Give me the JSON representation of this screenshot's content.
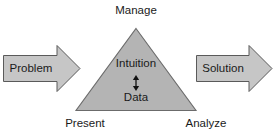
{
  "diagram": {
    "colors": {
      "shape_fill": "#b4b4b4",
      "shape_stroke": "#6b6b6b",
      "arrow_fill": "#c6c6c6",
      "arrow_stroke": "#5a5a5a",
      "text": "#1a1a1a",
      "background": "#ffffff"
    },
    "triangle": {
      "vertex_labels": {
        "top": "Manage",
        "bottom_left": "Present",
        "bottom_right": "Analyze"
      },
      "inner_nodes": [
        {
          "label": "Intuition"
        },
        {
          "label": "Data"
        }
      ],
      "inner_connector": "double-headed-vertical-arrow"
    },
    "input_arrow": {
      "label": "Problem",
      "direction": "right"
    },
    "output_arrow": {
      "label": "Solution",
      "direction": "right"
    }
  }
}
